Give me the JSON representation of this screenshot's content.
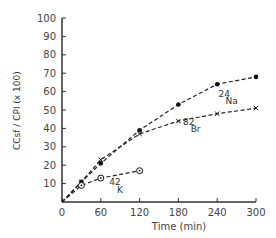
{
  "chart_data": {
    "type": "line",
    "title": "",
    "xlabel": "Time (min)",
    "ylabel": "C_Csf / C_Pl (x 100)",
    "xlim": [
      0,
      300
    ],
    "ylim": [
      0,
      100
    ],
    "xticks": [
      0,
      60,
      120,
      180,
      240,
      300
    ],
    "yticks": [
      10,
      20,
      30,
      40,
      50,
      60,
      70,
      80,
      90,
      100
    ],
    "series": [
      {
        "name": "24Na",
        "marker": "filled-circle",
        "x": [
          0,
          30,
          60,
          120,
          180,
          240,
          300
        ],
        "values": [
          0,
          11,
          21,
          39,
          53,
          64,
          68
        ]
      },
      {
        "name": "82Br",
        "marker": "x",
        "x": [
          0,
          30,
          60,
          120,
          180,
          240,
          300
        ],
        "values": [
          0,
          11,
          23,
          37,
          44,
          48,
          51
        ]
      },
      {
        "name": "42K",
        "marker": "circle-dot",
        "x": [
          0,
          30,
          60,
          120
        ],
        "values": [
          0,
          9,
          13,
          17
        ]
      }
    ],
    "annotations": [
      "24Na",
      "82Br",
      "42K"
    ],
    "grid": false
  },
  "labels": {
    "xlabel": "Time (min)",
    "ylabel_num": "C",
    "ylabel_num_sub": "Csf",
    "ylabel_den": "C",
    "ylabel_den_sub": "Pl",
    "ylabel_scale": "(x 100)",
    "na": "Na",
    "na_sup": "24",
    "br": "Br",
    "br_sup": "82",
    "k": "K",
    "k_sup": "42"
  }
}
